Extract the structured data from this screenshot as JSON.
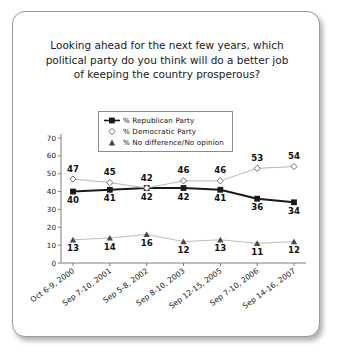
{
  "card": {
    "title_lines": [
      "Looking ahead for the next few years, which",
      "political party do you think will do a better job",
      "of keeping the country prosperous?"
    ]
  },
  "chart_data": {
    "type": "line",
    "title": "Looking ahead for the next few years, which political party do you think will do a better job of keeping the country prosperous?",
    "xlabel": "",
    "ylabel": "",
    "ylim": [
      0,
      70
    ],
    "yticks": [
      0,
      10,
      20,
      30,
      40,
      50,
      60,
      70
    ],
    "grid": false,
    "legend_position": "top-center",
    "categories": [
      "Oct 6-9, 2000",
      "Sep 7-10, 2001",
      "Sep 5-8, 2002",
      "Sep 8-10, 2003",
      "Sep 12-15, 2005",
      "Sep 7-10, 2006",
      "Sep 14-16, 2007"
    ],
    "series": [
      {
        "name": "% Republican Party",
        "marker": "square-filled",
        "color": "#1a1a1a",
        "line_color": "#1a1a1a",
        "line_width": 2,
        "label_position": "below",
        "values": [
          40,
          41,
          42,
          42,
          41,
          36,
          34
        ]
      },
      {
        "name": "% Democratic Party",
        "marker": "diamond-open",
        "color": "#6e6e6e",
        "line_color": "#b9b9b9",
        "line_width": 1,
        "label_position": "above",
        "values": [
          47,
          45,
          42,
          46,
          46,
          53,
          54
        ]
      },
      {
        "name": "% No difference/No opinion",
        "marker": "triangle-filled",
        "color": "#4a4a4a",
        "line_color": "#bdbdbd",
        "line_width": 1,
        "label_position": "below",
        "values": [
          13,
          14,
          16,
          12,
          13,
          11,
          12
        ]
      }
    ]
  }
}
